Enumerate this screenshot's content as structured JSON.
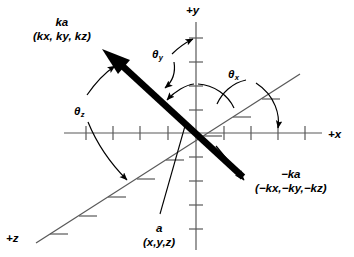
{
  "figure": {
    "type": "vector-coordinate-axes-diagram",
    "background_color": "#ffffff",
    "ink_color": "#000000",
    "axis_color": "#595959",
    "origin": {
      "x": 196,
      "y": 133
    }
  },
  "axes": [
    {
      "key": "x",
      "label": "+x",
      "label_x": 328,
      "label_y": 128
    },
    {
      "key": "y",
      "label": "+y",
      "label_x": 186,
      "label_y": 4
    },
    {
      "key": "z",
      "label": "+z",
      "label_x": 6,
      "label_y": 232
    }
  ],
  "vectors": {
    "ka": {
      "name": "ka",
      "components": "(kx, ky, kz)",
      "label_x": 33,
      "label_y": 16,
      "style": "thick-arrow"
    },
    "minus_ka": {
      "name": "−ka",
      "components": "(−kx,−ky,−kz)",
      "label_x": 255,
      "label_y": 168,
      "style": "thin-arrow-annotation"
    },
    "a": {
      "name": "a",
      "components": "(x,y,z)",
      "label_x": 143,
      "label_y": 222,
      "style": "leader-line-annotation"
    }
  },
  "angles": [
    {
      "key": "theta_y",
      "symbol": "θ",
      "sub": "y",
      "label_x": 152,
      "label_y": 48
    },
    {
      "key": "theta_x",
      "symbol": "θ",
      "sub": "x",
      "label_x": 228,
      "label_y": 68
    },
    {
      "key": "theta_z",
      "symbol": "θ",
      "sub": "z",
      "label_x": 74,
      "label_y": 105
    }
  ]
}
